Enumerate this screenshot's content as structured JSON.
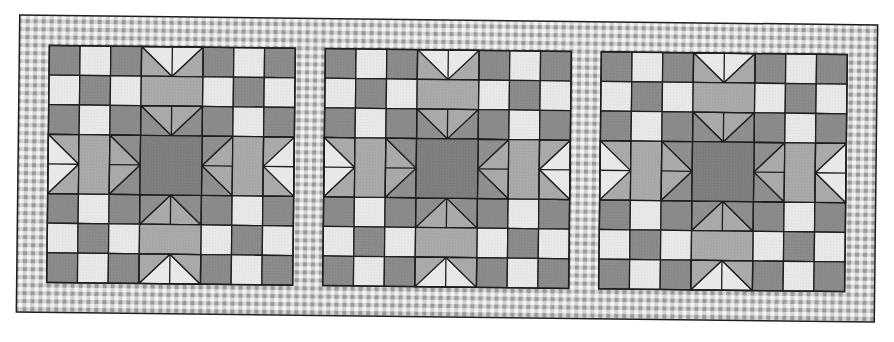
{
  "diagram": {
    "type": "quilt-table-runner",
    "block_count": 3,
    "block_grid_units": 8,
    "colors": {
      "background": "#ffffff",
      "outline": "#1e1e1e",
      "light": "#e8e8e8",
      "medium": "#a9a9a9",
      "dark": "#8a8a8a",
      "center": "#7e7e7e",
      "star_corner": "#8e8e8e",
      "gingham_light": "#f4f4f4",
      "gingham_mid": "#c8c8c8",
      "gingham_dark": "#9a9a9a"
    },
    "layout": {
      "outer_x": 18,
      "outer_y": 20,
      "border": 30,
      "block_w": 246,
      "block_h": 237,
      "sashing": 30,
      "rotation_deg": 0.66
    },
    "checker_pattern": [
      [
        "dark",
        "light",
        "dark"
      ],
      [
        "light",
        "dark",
        "light"
      ],
      [
        "dark",
        "light",
        "dark"
      ]
    ],
    "blocks": [
      {
        "name": "block-1"
      },
      {
        "name": "block-2"
      },
      {
        "name": "block-3"
      }
    ]
  }
}
